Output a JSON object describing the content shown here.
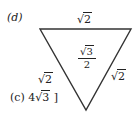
{
  "diagram": {
    "part_label": "(d)",
    "shape": "inverted-equilateral-triangle",
    "top_side_label": {
      "radical": "√",
      "radicand": "2"
    },
    "left_side_label": {
      "radical": "√",
      "radicand": "2"
    },
    "right_side_label": {
      "radical": "√",
      "radicand": "2"
    },
    "area_label": {
      "numerator_radical": "√",
      "numerator_radicand": "3",
      "denominator": "2"
    },
    "answer_option": {
      "prefix": "(c) 4",
      "radical": "√",
      "radicand": "3",
      "suffix": " ]"
    },
    "stroke_color": "#333333"
  }
}
